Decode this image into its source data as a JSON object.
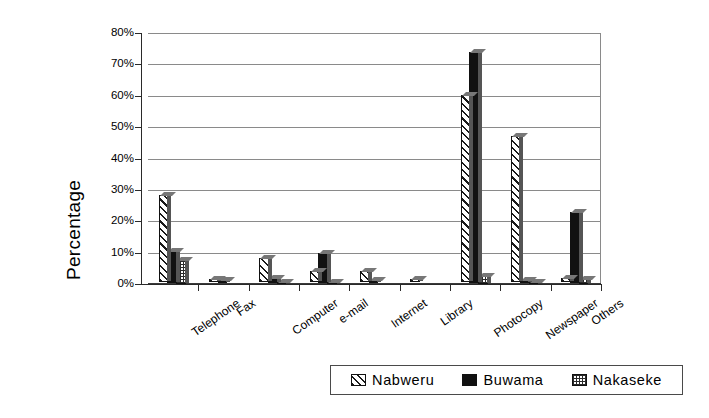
{
  "chart_data": {
    "type": "bar",
    "title": "",
    "xlabel": "",
    "ylabel": "Percentage",
    "ylim": [
      0,
      80
    ],
    "ytick_labels": [
      "0%",
      "10%",
      "20%",
      "30%",
      "40%",
      "50%",
      "60%",
      "70%",
      "80%"
    ],
    "ytick_values": [
      0,
      10,
      20,
      30,
      40,
      50,
      60,
      70,
      80
    ],
    "grid": true,
    "legend_position": "bottom-right",
    "categories": [
      "Telephone",
      "Fax",
      "Computer",
      "e-mail",
      "Internet",
      "Library",
      "Photocopy",
      "Newspaper",
      "Others"
    ],
    "series": [
      {
        "name": "Nabweru",
        "pattern": "diagonal-hatch",
        "color": "#ffffff",
        "values": [
          27.5,
          0.8,
          7.5,
          3.5,
          3.5,
          0.5,
          59.5,
          46.5,
          1.0
        ]
      },
      {
        "name": "Buwama",
        "pattern": "solid-black",
        "color": "#111111",
        "values": [
          10.0,
          0.8,
          1.5,
          9.5,
          0.5,
          0.0,
          73.5,
          1.0,
          22.5
        ]
      },
      {
        "name": "Nakaseke",
        "pattern": "grid-crosshatch",
        "color": "#ffffff",
        "values": [
          7.5,
          0.0,
          0.5,
          0.5,
          0.0,
          0.0,
          2.5,
          0.8,
          1.5
        ]
      }
    ]
  },
  "legend": {
    "items": [
      {
        "label": "Nabweru"
      },
      {
        "label": "Buwama"
      },
      {
        "label": "Nakaseke"
      }
    ]
  }
}
